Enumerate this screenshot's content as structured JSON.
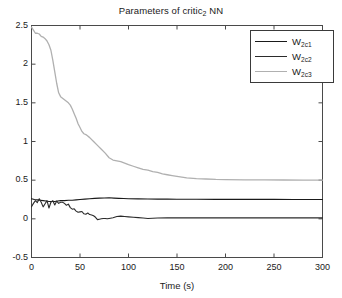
{
  "chart_data": {
    "type": "line",
    "title": "Parameters of critic2 NN",
    "title_main": "Parameters of critic",
    "title_sub": "2",
    "title_tail": " NN",
    "xlabel": "Time (s)",
    "ylabel": "",
    "xlim": [
      0,
      300
    ],
    "ylim": [
      -0.5,
      2.5
    ],
    "xticks": [
      0,
      50,
      100,
      150,
      200,
      250,
      300
    ],
    "xtick_labels": [
      "0",
      "50",
      "100",
      "150",
      "200",
      "250",
      "300"
    ],
    "yticks": [
      -0.5,
      0,
      0.5,
      1,
      1.5,
      2,
      2.5
    ],
    "ytick_labels": [
      "-0.5",
      "0",
      "0.5",
      "1",
      "1.5",
      "2",
      "2.5"
    ],
    "grid": false,
    "legend_position": "top-right",
    "legend": [
      {
        "name": "W2c1",
        "base": "W",
        "sub": "2c1",
        "color": "#1a1a1a"
      },
      {
        "name": "W2c2",
        "base": "W",
        "sub": "2c2",
        "color": "#2b2b2b"
      },
      {
        "name": "W2c3",
        "base": "W",
        "sub": "2c3",
        "color": "#b0b0b0"
      }
    ],
    "series": [
      {
        "name": "W2c1",
        "color": "#1a1a1a",
        "linewidth": 1.1,
        "x": [
          0,
          3,
          6,
          9,
          12,
          15,
          18,
          21,
          24,
          27,
          30,
          34,
          38,
          42,
          46,
          50,
          55,
          60,
          65,
          70,
          75,
          80,
          85,
          90,
          95,
          100,
          110,
          120,
          130,
          140,
          150,
          170,
          190,
          210,
          230,
          250,
          270,
          300
        ],
        "y": [
          0.26,
          0.25,
          0.245,
          0.24,
          0.235,
          0.23,
          0.225,
          0.225,
          0.225,
          0.23,
          0.235,
          0.235,
          0.24,
          0.24,
          0.245,
          0.25,
          0.255,
          0.26,
          0.265,
          0.268,
          0.27,
          0.272,
          0.268,
          0.265,
          0.262,
          0.26,
          0.258,
          0.256,
          0.255,
          0.255,
          0.254,
          0.253,
          0.252,
          0.252,
          0.251,
          0.251,
          0.25,
          0.25
        ]
      },
      {
        "name": "W2c2",
        "color": "#2b2b2b",
        "linewidth": 1.1,
        "x": [
          0,
          2,
          4,
          6,
          8,
          10,
          12,
          14,
          16,
          18,
          20,
          22,
          24,
          26,
          28,
          30,
          32,
          34,
          36,
          38,
          40,
          42,
          44,
          46,
          48,
          50,
          52,
          54,
          56,
          58,
          60,
          62,
          64,
          66,
          68,
          70,
          72,
          74,
          76,
          78,
          80,
          84,
          88,
          92,
          96,
          100,
          105,
          110,
          115,
          120,
          125,
          130,
          140,
          150,
          170,
          190,
          210,
          240,
          270,
          300
        ],
        "y": [
          0.155,
          0.2,
          0.235,
          0.21,
          0.26,
          0.215,
          0.155,
          0.195,
          0.235,
          0.14,
          0.215,
          0.235,
          0.18,
          0.23,
          0.2,
          0.215,
          0.215,
          0.2,
          0.175,
          0.19,
          0.145,
          0.125,
          0.13,
          0.1,
          0.085,
          0.09,
          0.095,
          0.065,
          0.06,
          0.075,
          0.055,
          0.05,
          0.04,
          0.02,
          -0.01,
          -0.005,
          0.0,
          0.005,
          0.005,
          0.0,
          0.005,
          0.015,
          0.03,
          0.035,
          0.03,
          0.025,
          0.02,
          0.015,
          0.01,
          0.005,
          0.008,
          0.01,
          0.012,
          0.012,
          0.012,
          0.012,
          0.012,
          0.012,
          0.012,
          0.012
        ]
      },
      {
        "name": "W2c3",
        "color": "#b0b0b0",
        "linewidth": 1.3,
        "x": [
          0,
          2,
          4,
          6,
          8,
          10,
          12,
          14,
          16,
          18,
          20,
          22,
          24,
          26,
          28,
          30,
          32,
          34,
          36,
          38,
          40,
          42,
          44,
          46,
          48,
          50,
          52,
          54,
          56,
          58,
          60,
          64,
          68,
          72,
          76,
          80,
          84,
          88,
          92,
          96,
          100,
          105,
          110,
          115,
          120,
          125,
          130,
          135,
          140,
          145,
          150,
          160,
          170,
          180,
          190,
          200,
          220,
          240,
          260,
          280,
          300
        ],
        "y": [
          2.48,
          2.44,
          2.4,
          2.4,
          2.39,
          2.36,
          2.35,
          2.33,
          2.3,
          2.25,
          2.18,
          2.05,
          1.9,
          1.75,
          1.63,
          1.58,
          1.56,
          1.54,
          1.52,
          1.5,
          1.47,
          1.42,
          1.36,
          1.3,
          1.23,
          1.18,
          1.13,
          1.1,
          1.09,
          1.07,
          1.05,
          1.0,
          0.95,
          0.9,
          0.85,
          0.79,
          0.76,
          0.75,
          0.74,
          0.72,
          0.7,
          0.68,
          0.66,
          0.64,
          0.63,
          0.61,
          0.6,
          0.58,
          0.57,
          0.56,
          0.55,
          0.53,
          0.52,
          0.515,
          0.51,
          0.508,
          0.505,
          0.503,
          0.502,
          0.501,
          0.5
        ]
      }
    ]
  }
}
